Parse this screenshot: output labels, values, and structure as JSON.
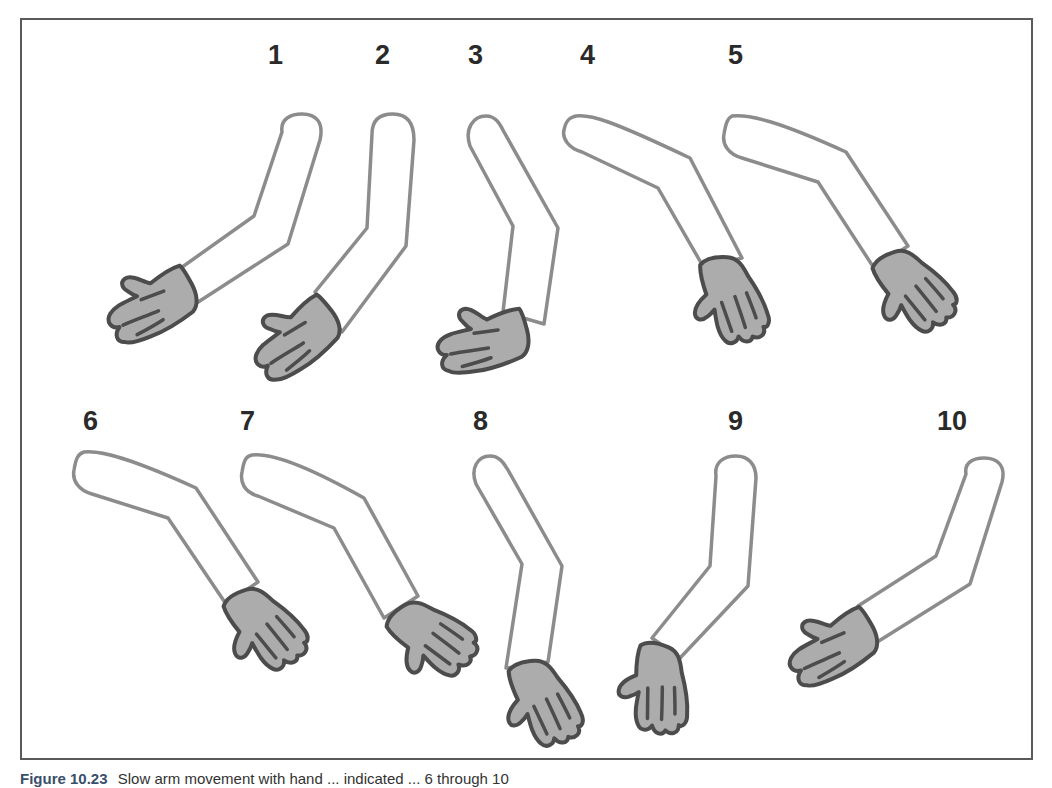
{
  "figure": {
    "caption_label": "Figure 10.23",
    "caption_text": "Slow arm movement with hand ... indicated ... 6 through 10",
    "colors": {
      "border": "#5a5a5a",
      "arm_outline": "#8c8c8c",
      "hand_fill": "#acacac",
      "hand_outline": "#4c4c4c",
      "label": "#2a2a2a",
      "caption_label": "#3a4f6a"
    },
    "frames": [
      {
        "label": "1"
      },
      {
        "label": "2"
      },
      {
        "label": "3"
      },
      {
        "label": "4"
      },
      {
        "label": "5"
      },
      {
        "label": "6"
      },
      {
        "label": "7"
      },
      {
        "label": "8"
      },
      {
        "label": "9"
      },
      {
        "label": "10"
      }
    ]
  }
}
